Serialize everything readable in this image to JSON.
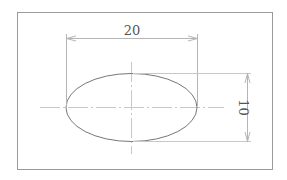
{
  "diagram": {
    "type": "engineering-drawing",
    "dimensions": {
      "width_label": "20",
      "height_label": "10"
    },
    "colors": {
      "frame": "#9a9a9a",
      "outline": "#777777",
      "dimension": "#b5b5b5",
      "centerline": "#c8c8c8",
      "text": "#555555"
    }
  }
}
